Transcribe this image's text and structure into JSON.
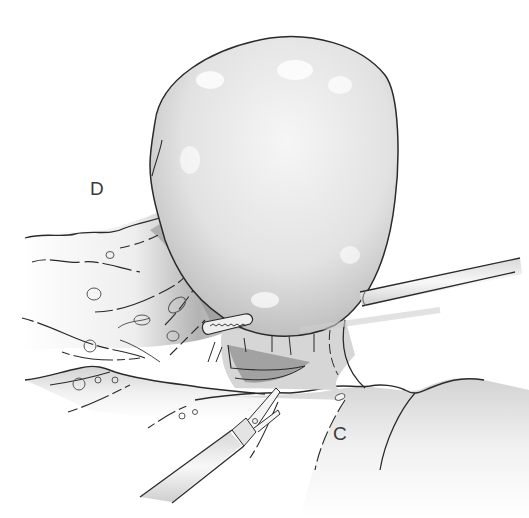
{
  "illustration": {
    "type": "surgical line illustration",
    "labels": {
      "d": "D",
      "c": "C"
    },
    "colors": {
      "outline": "#2a2a2a",
      "shade_dark": "#8c8c8c",
      "shade_mid": "#c4c4c4",
      "shade_light": "#e6e6e6",
      "background": "#ffffff"
    }
  }
}
